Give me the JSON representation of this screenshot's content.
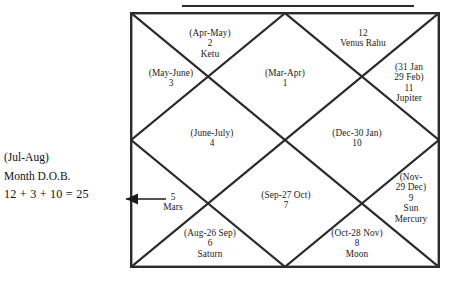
{
  "diagram": {
    "kind": "north-indian-vedic-birth-chart",
    "title_rule": true,
    "houses": [
      {
        "id": "house-1",
        "number": "1",
        "range": "(Mar-Apr)",
        "planets": ""
      },
      {
        "id": "house-2",
        "number": "2",
        "range": "(Apr-May)",
        "planets": "Ketu"
      },
      {
        "id": "house-3",
        "number": "3",
        "range": "(May-June)",
        "planets": ""
      },
      {
        "id": "house-4",
        "number": "4",
        "range": "(June-July)",
        "planets": ""
      },
      {
        "id": "house-5",
        "number": "5",
        "range": "",
        "planets": "Mars"
      },
      {
        "id": "house-6",
        "number": "6",
        "range": "(Aug-26 Sep)",
        "planets": "Saturn"
      },
      {
        "id": "house-7",
        "number": "7",
        "range": "(Sep-27 Oct)",
        "planets": ""
      },
      {
        "id": "house-8",
        "number": "8",
        "range": "(Oct-28 Nov)",
        "planets": "Moon"
      },
      {
        "id": "house-9",
        "number": "9",
        "range_line1": "(Nov-",
        "range_line2": "29 Dec)",
        "number_only": "9",
        "planets_line1": "Sun",
        "planets_line2": "Mercury"
      },
      {
        "id": "house-10",
        "number": "10",
        "range": "(Dec-30 Jan)",
        "planets": ""
      },
      {
        "id": "house-11",
        "number": "11",
        "range_line1": "(31 Jan",
        "range_line2": "29 Feb)",
        "number_only": "11",
        "planets_line1": "Jupiter",
        "planets_line2": ""
      },
      {
        "id": "house-12",
        "number": "12",
        "range": "",
        "planets": "Venus Rahu"
      }
    ],
    "annotation": {
      "line1": "(Jul-Aug)",
      "line2": "Month D.O.B.",
      "equation": "12 + 3 + 10 = 25",
      "points_to_house": "5"
    },
    "colors": {
      "ink": "#1a1a1a",
      "line": "#2b2b2b",
      "background": "#ffffff"
    }
  }
}
